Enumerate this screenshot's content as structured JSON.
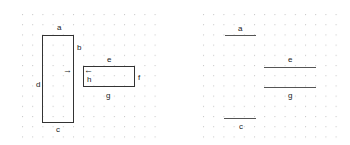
{
  "left_figure": {
    "rects": [
      {
        "name": "tall-rectangle",
        "x": 42,
        "y": 35,
        "w": 32,
        "h": 88
      },
      {
        "name": "wide-rectangle",
        "x": 83,
        "y": 66,
        "w": 52,
        "h": 21
      }
    ],
    "labels": {
      "a": "a",
      "b": "b",
      "c": "c",
      "d": "d",
      "e": "e",
      "f": "f",
      "g": "g",
      "h": "h"
    },
    "arrows": {
      "right": "→",
      "left": "←"
    }
  },
  "right_figure": {
    "labels": {
      "a": "a",
      "e": "e",
      "g": "g",
      "c": "c"
    }
  },
  "colors": {
    "line": "#333333",
    "dot": "#c8c8c8"
  }
}
